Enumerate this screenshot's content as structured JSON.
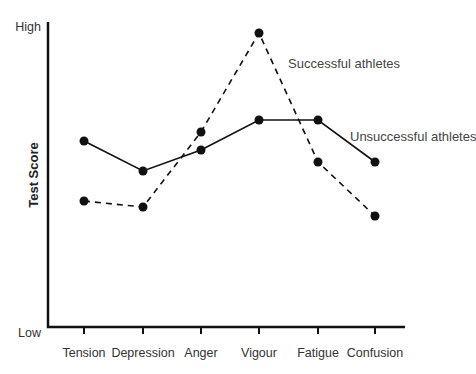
{
  "chart_data": {
    "type": "line",
    "title": "",
    "xlabel": "",
    "ylabel": "Test Score",
    "y_tick_labels": {
      "low": "Low",
      "high": "High"
    },
    "ylim": [
      0,
      100
    ],
    "grid": false,
    "legend": "inline labels next to lines",
    "categories": [
      "Tension",
      "Depression",
      "Anger",
      "Vigour",
      "Fatigue",
      "Confusion"
    ],
    "series": [
      {
        "name": "Unsuccessful athletes",
        "style": "solid",
        "color": "#111111",
        "values": [
          62,
          52,
          59,
          69,
          69,
          55
        ]
      },
      {
        "name": "Successful athletes",
        "style": "dashed",
        "color": "#111111",
        "values": [
          42,
          40,
          65,
          98,
          55,
          37
        ]
      }
    ]
  },
  "layout": {
    "plot_left": 48,
    "plot_top": 22,
    "plot_bottom": 327,
    "plot_right": 405,
    "y0_px": 327,
    "y100_px": 27,
    "cat_x": [
      84,
      143,
      201,
      259,
      318,
      375
    ],
    "labels": {
      "successful": {
        "x": 288,
        "y": 68
      },
      "unsuccessful": {
        "x": 350,
        "y": 141
      }
    }
  }
}
